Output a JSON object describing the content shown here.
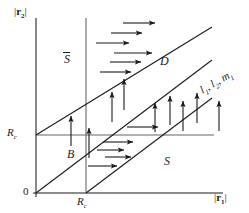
{
  "figure": {
    "kind": "phase-plane-stability-diagram",
    "axes": {
      "x_label_prefix": "|",
      "x_label_var": "r",
      "x_label_sub": "1",
      "x_label_suffix": "|",
      "x_label_text": "|r1|",
      "y_label_prefix": "|",
      "y_label_var": "r",
      "y_label_sub": "2",
      "y_label_suffix": "|",
      "y_label_text": "|r2|",
      "origin_label": "0"
    },
    "ticks": [
      {
        "name": "x-tick-rc",
        "var": "R",
        "sub": "c",
        "text": "Rc",
        "axis": "x"
      },
      {
        "name": "y-tick-rc",
        "var": "R",
        "sub": "c",
        "text": "Rc",
        "axis": "y"
      }
    ],
    "regions": [
      {
        "name": "region-s-bar",
        "label": "S",
        "overbar": true
      },
      {
        "name": "region-d",
        "label": "D",
        "overbar": false
      },
      {
        "name": "region-b",
        "label": "B",
        "overbar": false
      },
      {
        "name": "region-s",
        "label": "S",
        "overbar": false
      }
    ],
    "line_label": {
      "name": "line-family-label",
      "parts": [
        {
          "var": "l",
          "sub": "1"
        },
        {
          "var": "l",
          "sub": "2"
        },
        {
          "var": "m",
          "sub": "1"
        }
      ],
      "text": "l1, l2, m1"
    },
    "colors": {
      "stroke": "#1a1a1a",
      "guide": "#555555",
      "background": "#ffffff"
    },
    "arrows": {
      "horizontal_count": 13,
      "vertical_count": 12,
      "direction_horizontal": "right",
      "direction_vertical": "up"
    }
  }
}
